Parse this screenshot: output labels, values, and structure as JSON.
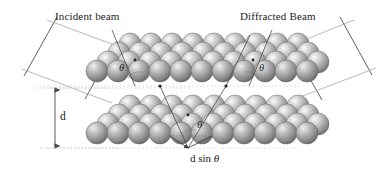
{
  "figure": {
    "title_text": "Bragg diffraction from crystal lattice planes",
    "labels": {
      "incident_beam": "Incident beam",
      "diffracted_beam": "Diffracted Beam",
      "interplanar_spacing": "d",
      "path_difference_prefix": "d sin ",
      "theta_symbol": "θ"
    },
    "angle_labels": [
      {
        "name": "theta-incident",
        "text": "θ"
      },
      {
        "name": "theta-diffracted",
        "text": "θ"
      },
      {
        "name": "theta-lower-plane",
        "text": "θ"
      }
    ],
    "colors": {
      "background": "#ffffff",
      "sphere_light": "#f2f2f2",
      "sphere_mid": "#a8a8a8",
      "sphere_dark": "#6e6e6e",
      "sphere_edge": "#5a5a5a",
      "beam_line": "#4a4a4a",
      "ray_line": "#9a9a9a",
      "dimension_line": "#7a7a7a",
      "text": "#1b1b1b"
    },
    "geometry": {
      "top_plane_rows": 4,
      "top_plane_cols": 10,
      "bottom_plane_rows": 4,
      "bottom_plane_cols": 10,
      "sphere_radius_px": 11,
      "row_step_x_px": 11,
      "row_step_y_px": -9,
      "col_step_x_px": 21,
      "plane_separation_px": 60
    }
  }
}
